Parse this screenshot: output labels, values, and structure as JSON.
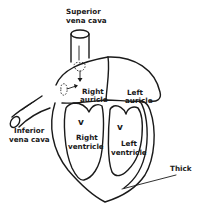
{
  "diagram": {
    "type": "anatomical-line-drawing",
    "labels": {
      "superior_vena_cava": [
        "Superior",
        "vena cava"
      ],
      "right_auricle": [
        "Right",
        "auricle"
      ],
      "left_auricle": [
        "Left",
        "auricle"
      ],
      "inferior_vena_cava": [
        "Inferior",
        "vena cava"
      ],
      "right_ventricle": [
        "Right",
        "ventricle"
      ],
      "left_ventricle": [
        "Left",
        "ventricle"
      ],
      "thick": "Thick"
    },
    "valve_marks": [
      "v",
      "v"
    ],
    "colors": {
      "line": "#1a1a1a",
      "background": "#ffffff"
    }
  }
}
